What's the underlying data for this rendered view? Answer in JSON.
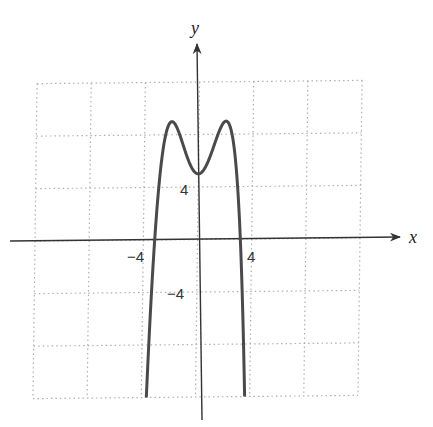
{
  "chart_data": {
    "type": "line",
    "title": "",
    "xlabel": "x",
    "ylabel": "y",
    "xlim": [
      -12,
      12
    ],
    "ylim": [
      -12,
      12
    ],
    "grid": true,
    "grid_step": 4,
    "tick_labels": {
      "x": [
        {
          "value": -4,
          "label": "−4"
        },
        {
          "value": 4,
          "label": "4"
        }
      ],
      "y": [
        {
          "value": 4,
          "label": "4"
        },
        {
          "value": -4,
          "label": "−4"
        }
      ]
    },
    "series": [
      {
        "name": "f(x)",
        "description": "Even quartic with two local maxima near (±2, 9), local minimum (0, 5), x-intercepts near ±3.2, falling off toward -∞",
        "x": [
          -3.63,
          -3.5,
          -3.2,
          -3.0,
          -2.5,
          -2.0,
          -1.5,
          -1.0,
          -0.5,
          0,
          0.5,
          1.0,
          1.5,
          2.0,
          2.5,
          3.0,
          3.2,
          3.5,
          3.63
        ],
        "y": [
          -12,
          -9.5,
          -0.7,
          2.75,
          7.7,
          9.0,
          8.2,
          6.75,
          5.5,
          5.0,
          5.5,
          6.75,
          8.2,
          9.0,
          7.7,
          2.75,
          -0.7,
          -9.5,
          -12
        ]
      }
    ]
  },
  "labels": {
    "x_axis": "x",
    "y_axis": "y",
    "x_neg4": "−4",
    "x_pos4": "4",
    "y_pos4": "4",
    "y_neg4": "−4"
  },
  "colors": {
    "curve": "#4a4a4a",
    "axis": "#333333",
    "grid": "#b0b0b0"
  }
}
